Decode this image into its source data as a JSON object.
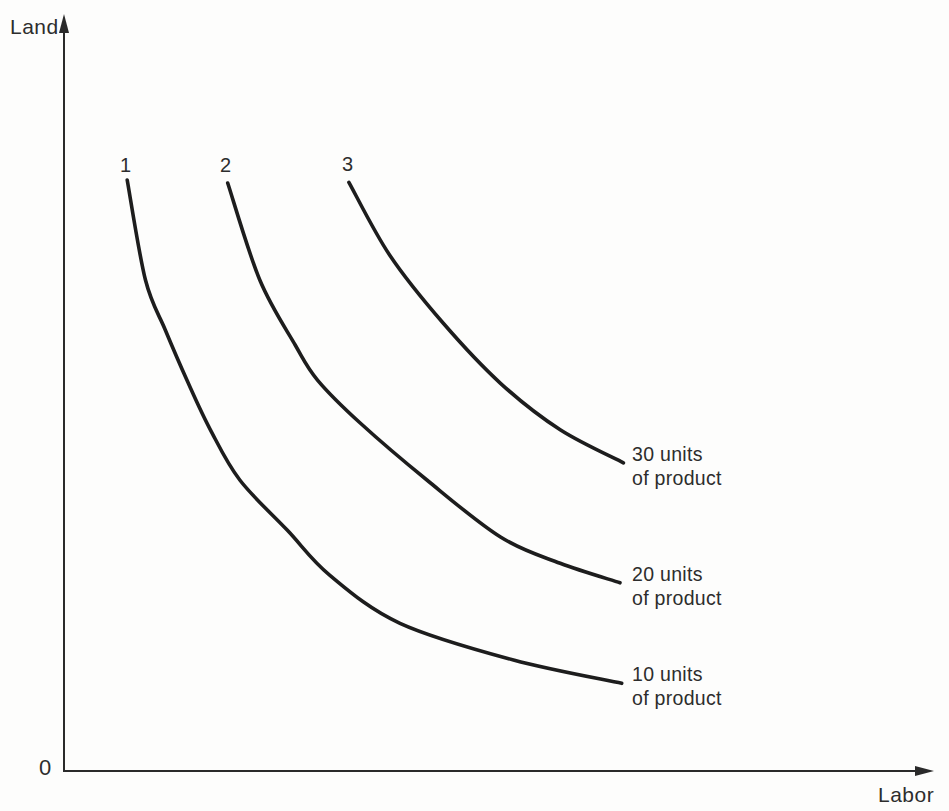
{
  "colors": {
    "axis": "#2a2a2a",
    "curve": "#1d1d1d",
    "text": "#2d2d2d",
    "background": "#fdfdfc"
  },
  "chart_data": {
    "type": "line",
    "subtype": "isoquant-curves",
    "title": "",
    "xlabel": "Labor",
    "ylabel": "Land",
    "origin_label": "0",
    "x_range": [
      0,
      10
    ],
    "y_range": [
      0,
      10
    ],
    "grid": false,
    "legend": false,
    "ticks": "none (qualitative axes, arbitrary units)",
    "series": [
      {
        "curve_number": "1",
        "units_of_product": 10,
        "product_label_line1": "10 units",
        "product_label_line2": "of product",
        "points": [
          [
            0.73,
            7.88
          ],
          [
            0.94,
            6.55
          ],
          [
            1.17,
            5.88
          ],
          [
            1.42,
            5.21
          ],
          [
            1.69,
            4.55
          ],
          [
            2.03,
            3.88
          ],
          [
            2.58,
            3.21
          ],
          [
            3.07,
            2.61
          ],
          [
            3.88,
            1.97
          ],
          [
            5.19,
            1.48
          ],
          [
            6.44,
            1.17
          ]
        ]
      },
      {
        "curve_number": "2",
        "units_of_product": 20,
        "product_label_line1": "20 units",
        "product_label_line2": "of product",
        "points": [
          [
            1.89,
            7.84
          ],
          [
            2.26,
            6.55
          ],
          [
            2.67,
            5.68
          ],
          [
            2.93,
            5.21
          ],
          [
            3.42,
            4.64
          ],
          [
            4.19,
            3.88
          ],
          [
            5.04,
            3.12
          ],
          [
            5.73,
            2.77
          ],
          [
            6.42,
            2.51
          ]
        ]
      },
      {
        "curve_number": "3",
        "units_of_product": 30,
        "product_label_line1": "30 units",
        "product_label_line2": "of product",
        "points": [
          [
            3.29,
            7.85
          ],
          [
            3.76,
            6.88
          ],
          [
            4.38,
            5.97
          ],
          [
            5.04,
            5.17
          ],
          [
            5.73,
            4.55
          ],
          [
            6.46,
            4.11
          ]
        ]
      }
    ]
  }
}
